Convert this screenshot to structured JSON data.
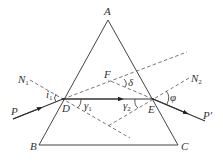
{
  "diagram": {
    "type": "physics-optics",
    "points": {
      "A": {
        "label": "A",
        "x": 108,
        "y": 20
      },
      "B": {
        "label": "B",
        "x": 39,
        "y": 145
      },
      "C": {
        "label": "C",
        "x": 178,
        "y": 145
      },
      "D": {
        "label": "D",
        "x": 63,
        "y": 99
      },
      "E": {
        "label": "E",
        "x": 153,
        "y": 99
      },
      "F": {
        "label": "F",
        "x": 108,
        "y": 80
      },
      "G": {
        "label": "",
        "x": 108,
        "y": 126
      }
    },
    "labels": {
      "A": "A",
      "B": "B",
      "C": "C",
      "D": "D",
      "E": "E",
      "F": "F",
      "P": "P",
      "P_prime": "P′",
      "N1": "N",
      "N1_sub": "1",
      "N2": "N",
      "N2_sub": "2",
      "i1": "i",
      "i1_sub": "1",
      "gamma1": "γ",
      "gamma1_sub": "1",
      "gamma2": "γ",
      "gamma2_sub": "2",
      "delta": "δ",
      "phi": "φ"
    },
    "lines": [
      {
        "name": "prism-side-AB",
        "style": "solid",
        "from": "A",
        "to": "B"
      },
      {
        "name": "prism-side-AC",
        "style": "solid",
        "from": "A",
        "to": "C"
      },
      {
        "name": "prism-base-BC",
        "style": "solid",
        "from": "B",
        "to": "C"
      },
      {
        "name": "incident-ray-PD",
        "style": "solid-arrow"
      },
      {
        "name": "refracted-ray-DE",
        "style": "solid-arrow"
      },
      {
        "name": "emergent-ray-EP'",
        "style": "solid-arrow"
      },
      {
        "name": "normal-N1",
        "style": "dashed"
      },
      {
        "name": "normal-N2",
        "style": "dashed"
      },
      {
        "name": "incident-extension",
        "style": "dashed"
      },
      {
        "name": "emergent-extension",
        "style": "dashed"
      }
    ],
    "angles": [
      "i1",
      "γ1",
      "γ2",
      "δ",
      "φ"
    ]
  }
}
